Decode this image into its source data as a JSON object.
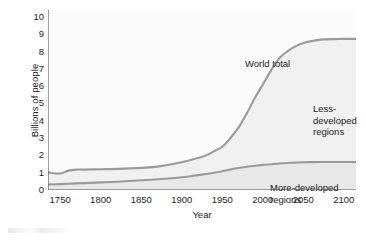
{
  "chart_data": {
    "type": "area",
    "title": "",
    "xlabel": "Year",
    "ylabel": "Billions of people",
    "xlim": [
      1735,
      2115
    ],
    "ylim": [
      0,
      10.4
    ],
    "xticks": [
      1750,
      1800,
      1850,
      1900,
      1950,
      2000,
      2050,
      2100
    ],
    "yticks": [
      0,
      1,
      2,
      3,
      4,
      5,
      6,
      7,
      8,
      9,
      10
    ],
    "grid": false,
    "legend_position": "in-plot annotations",
    "annotations": [
      {
        "text": "World total",
        "x": 1960,
        "y": 7.4
      },
      {
        "text": "Less-developed\nregions",
        "x": 2045,
        "y": 5.0
      },
      {
        "text": "More-developed regions",
        "x": 2010,
        "y": 0.55
      }
    ],
    "x": [
      1735,
      1750,
      1760,
      1770,
      1780,
      1800,
      1820,
      1850,
      1870,
      1900,
      1920,
      1930,
      1940,
      1950,
      1960,
      1970,
      1980,
      1990,
      2000,
      2010,
      2020,
      2030,
      2040,
      2050,
      2060,
      2075,
      2090,
      2100,
      2115
    ],
    "series": [
      {
        "name": "World total",
        "values": [
          1.02,
          0.95,
          1.12,
          1.18,
          1.18,
          1.2,
          1.22,
          1.28,
          1.35,
          1.6,
          1.85,
          2.0,
          2.25,
          2.5,
          3.0,
          3.6,
          4.4,
          5.3,
          6.1,
          6.9,
          7.6,
          8.0,
          8.3,
          8.5,
          8.6,
          8.7,
          8.72,
          8.73,
          8.73
        ]
      },
      {
        "name": "More-developed regions",
        "values": [
          0.32,
          0.34,
          0.36,
          0.38,
          0.4,
          0.44,
          0.48,
          0.56,
          0.62,
          0.74,
          0.86,
          0.92,
          1.0,
          1.08,
          1.18,
          1.27,
          1.34,
          1.4,
          1.45,
          1.49,
          1.53,
          1.56,
          1.58,
          1.6,
          1.61,
          1.62,
          1.62,
          1.62,
          1.62
        ]
      }
    ],
    "bands": [
      {
        "name": "Less-developed regions",
        "between": [
          "More-developed regions",
          "World total"
        ],
        "fill": "#f0f0f0"
      },
      {
        "name": "More-developed regions",
        "between": [
          "baseline",
          "More-developed regions"
        ],
        "fill": "#e6e6e6"
      }
    ],
    "colors": {
      "line": "#9a9a9a",
      "axis": "#4d4d4d",
      "band_less_developed": "#f0f0f0",
      "band_more_developed": "#e8e8e8",
      "plot_background": "#fbfbfb",
      "text": "#1a1a1a"
    }
  }
}
